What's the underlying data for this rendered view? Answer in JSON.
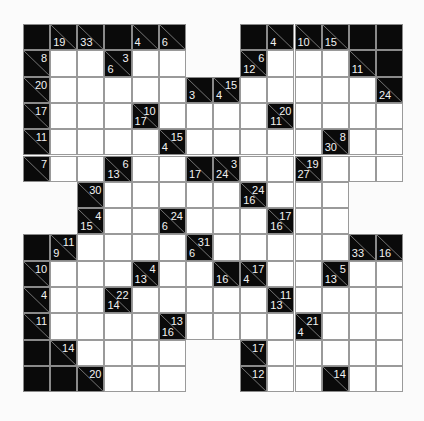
{
  "puzzle": {
    "type": "Kakuro",
    "rows": 14,
    "cols": 14,
    "legend": "Each clue cell: 'r' = across sum (top-right), 'd' = down sum (bottom-left). 'W' = empty white cell, 'B' = solid black cell, null = outside grid.",
    "grid": [
      [
        "B",
        {
          "d": 19
        },
        {
          "d": 33
        },
        "B",
        {
          "d": 4
        },
        {
          "d": 6
        },
        null,
        null,
        "B",
        {
          "d": 4
        },
        {
          "d": 10
        },
        {
          "d": 15
        },
        "B",
        "B"
      ],
      [
        {
          "r": 8
        },
        "W",
        "W",
        {
          "r": 3,
          "d": 6
        },
        "W",
        "W",
        null,
        null,
        {
          "r": 6,
          "d": 12
        },
        "W",
        "W",
        "W",
        {
          "d": 11
        },
        "B"
      ],
      [
        {
          "r": 20
        },
        "W",
        "W",
        "W",
        "W",
        "W",
        {
          "d": 3
        },
        {
          "r": 15,
          "d": 4
        },
        "W",
        "W",
        "W",
        "W",
        "W",
        {
          "d": 24
        }
      ],
      [
        {
          "r": 17
        },
        "W",
        "W",
        "W",
        {
          "r": 10,
          "d": 17
        },
        "W",
        "W",
        "W",
        "W",
        {
          "r": 20,
          "d": 11
        },
        "W",
        "W",
        "W",
        "W"
      ],
      [
        {
          "r": 11
        },
        "W",
        "W",
        "W",
        "W",
        {
          "r": 15,
          "d": 4
        },
        "W",
        "W",
        "W",
        "W",
        "W",
        {
          "r": 8,
          "d": 30
        },
        "W",
        "W"
      ],
      [
        {
          "r": 7
        },
        "W",
        "W",
        {
          "r": 6,
          "d": 13
        },
        "W",
        "W",
        {
          "d": 17
        },
        {
          "r": 3,
          "d": 24
        },
        "W",
        "W",
        {
          "r": 19,
          "d": 27
        },
        "W",
        "W",
        "W"
      ],
      [
        null,
        null,
        {
          "r": 30
        },
        "W",
        "W",
        "W",
        "W",
        "W",
        {
          "r": 24,
          "d": 16
        },
        "W",
        "W",
        "W",
        null,
        null
      ],
      [
        null,
        null,
        {
          "r": 4,
          "d": 15
        },
        "W",
        "W",
        {
          "r": 24,
          "d": 6
        },
        "W",
        "W",
        "W",
        {
          "r": 17,
          "d": 16
        },
        "W",
        "W",
        null,
        null
      ],
      [
        "B",
        {
          "r": 11,
          "d": 9
        },
        "W",
        "W",
        "W",
        "W",
        {
          "r": 31,
          "d": 6
        },
        "W",
        "W",
        "W",
        "W",
        "W",
        {
          "d": 33
        },
        {
          "d": 16
        }
      ],
      [
        {
          "r": 10
        },
        "W",
        "W",
        "W",
        {
          "r": 4,
          "d": 13
        },
        "W",
        "W",
        {
          "d": 16
        },
        {
          "r": 17,
          "d": 4
        },
        "W",
        "W",
        {
          "r": 5,
          "d": 13
        },
        "W",
        "W"
      ],
      [
        {
          "r": 4
        },
        "W",
        "W",
        {
          "r": 22,
          "d": 14
        },
        "W",
        "W",
        "W",
        "W",
        "W",
        {
          "r": 11,
          "d": 13
        },
        "W",
        "W",
        "W",
        "W"
      ],
      [
        {
          "r": 11
        },
        "W",
        "W",
        "W",
        "W",
        {
          "r": 13,
          "d": 16
        },
        "W",
        "W",
        "W",
        "W",
        {
          "r": 21,
          "d": 4
        },
        "W",
        "W",
        "W"
      ],
      [
        "B",
        {
          "r": 14
        },
        "W",
        "W",
        "W",
        "W",
        null,
        null,
        {
          "r": 17
        },
        "W",
        "W",
        "W",
        "W",
        "W"
      ],
      [
        "B",
        "B",
        {
          "r": 20
        },
        "W",
        "W",
        "W",
        null,
        null,
        {
          "r": 12
        },
        "W",
        "W",
        {
          "r": 14
        },
        "W",
        "W"
      ]
    ]
  },
  "colors": {
    "black_cell": "#0a0a0a",
    "white_cell": "#ffffff",
    "grid_line": "#9a9a9a",
    "clue_text": "#f2f2f2",
    "background": "#fbfbfb"
  }
}
